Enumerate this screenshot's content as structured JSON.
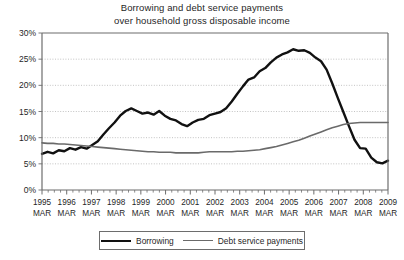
{
  "chart_data": {
    "type": "line",
    "title": "Borrowing and debt service payments over household gross disposable income",
    "title_lines": [
      "Borrowing and debt service payments",
      "over household gross disposable income"
    ],
    "xlabel": "",
    "ylabel": "",
    "ylim": [
      0,
      30
    ],
    "yticks": [
      0,
      5,
      10,
      15,
      20,
      25,
      30
    ],
    "ytick_labels": [
      "0%",
      "5%",
      "10%",
      "15%",
      "20%",
      "25%",
      "30%"
    ],
    "grid": true,
    "grid_style": "dotted-horizontal",
    "legend_position": "bottom-center",
    "x_major_labels": [
      {
        "year": "1995",
        "month": "MAR"
      },
      {
        "year": "1996",
        "month": "MAR"
      },
      {
        "year": "1997",
        "month": "MAR"
      },
      {
        "year": "1998",
        "month": "MAR"
      },
      {
        "year": "1999",
        "month": "MAR"
      },
      {
        "year": "2000",
        "month": "MAR"
      },
      {
        "year": "2001",
        "month": "MAR"
      },
      {
        "year": "2002",
        "month": "MAR"
      },
      {
        "year": "2003",
        "month": "MAR"
      },
      {
        "year": "2004",
        "month": "MAR"
      },
      {
        "year": "2005",
        "month": "MAR"
      },
      {
        "year": "2006",
        "month": "MAR"
      },
      {
        "year": "2007",
        "month": "MAR"
      },
      {
        "year": "2008",
        "month": "MAR"
      },
      {
        "year": "2009",
        "month": "MAR"
      }
    ],
    "x_tick_interval": "quarterly",
    "x_start": 1995.2,
    "x_end": 2009.2,
    "series": [
      {
        "name": "Borrowing",
        "color": "#111111",
        "width": 2.4,
        "values": [
          6.9,
          7.3,
          7.0,
          7.6,
          7.4,
          8.0,
          7.7,
          8.2,
          7.9,
          8.6,
          9.3,
          10.6,
          11.8,
          12.9,
          14.2,
          15.1,
          15.6,
          15.1,
          14.6,
          14.8,
          14.4,
          15.1,
          14.2,
          13.6,
          13.3,
          12.6,
          12.2,
          12.9,
          13.4,
          13.6,
          14.3,
          14.6,
          14.9,
          15.6,
          16.9,
          18.4,
          19.8,
          21.1,
          21.5,
          22.7,
          23.3,
          24.4,
          25.3,
          25.9,
          26.3,
          26.9,
          26.6,
          26.7,
          26.2,
          25.3,
          24.6,
          23.0,
          20.4,
          17.6,
          14.9,
          12.2,
          9.6,
          8.0,
          7.9,
          6.2,
          5.3,
          5.1,
          5.6
        ]
      },
      {
        "name": "Debt service payments",
        "color": "#6a6a6a",
        "width": 1.6,
        "values": [
          9.0,
          8.9,
          8.9,
          8.8,
          8.8,
          8.7,
          8.6,
          8.5,
          8.4,
          8.3,
          8.2,
          8.1,
          8.0,
          7.9,
          7.8,
          7.7,
          7.6,
          7.5,
          7.4,
          7.3,
          7.3,
          7.2,
          7.2,
          7.2,
          7.1,
          7.1,
          7.1,
          7.1,
          7.1,
          7.2,
          7.3,
          7.3,
          7.3,
          7.3,
          7.3,
          7.4,
          7.4,
          7.5,
          7.6,
          7.7,
          7.9,
          8.1,
          8.3,
          8.6,
          8.9,
          9.2,
          9.5,
          9.9,
          10.3,
          10.7,
          11.1,
          11.5,
          11.9,
          12.2,
          12.5,
          12.7,
          12.8,
          12.9,
          12.9,
          12.9,
          12.9,
          12.9,
          12.9
        ]
      }
    ]
  },
  "legend": {
    "items": [
      {
        "label": "Borrowing"
      },
      {
        "label": "Debt service payments"
      }
    ]
  }
}
